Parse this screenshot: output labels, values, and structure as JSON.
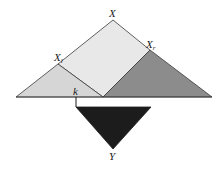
{
  "diagram": {
    "labels": {
      "root": "X",
      "left": "X",
      "left_sub": "l",
      "right": "X",
      "right_sub": "r",
      "split_point": "k",
      "bottom": "Y"
    },
    "colors": {
      "background": "#ffffff",
      "left_triangle": "#d6d6d6",
      "root_region": "#e8e8e8",
      "right_triangle": "#8c8c8c",
      "bottom_triangle": "#1c1c1c",
      "stroke": "#3a3a3a"
    }
  }
}
